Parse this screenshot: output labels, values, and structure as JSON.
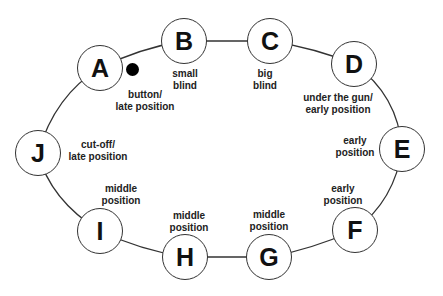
{
  "dealer_button": {
    "label": "dealer button",
    "seat": "A"
  },
  "seats": [
    {
      "letter": "A",
      "line1": "button/",
      "line2": "late position"
    },
    {
      "letter": "B",
      "line1": "small",
      "line2": "blind"
    },
    {
      "letter": "C",
      "line1": "big",
      "line2": "blind"
    },
    {
      "letter": "D",
      "line1": "under the gun/",
      "line2": "early position"
    },
    {
      "letter": "E",
      "line1": "early",
      "line2": "position"
    },
    {
      "letter": "F",
      "line1": "early",
      "line2": "position"
    },
    {
      "letter": "G",
      "line1": "middle",
      "line2": "position"
    },
    {
      "letter": "H",
      "line1": "middle",
      "line2": "position"
    },
    {
      "letter": "I",
      "line1": "middle",
      "line2": "position"
    },
    {
      "letter": "J",
      "line1": "cut-off/",
      "line2": "late position"
    }
  ]
}
